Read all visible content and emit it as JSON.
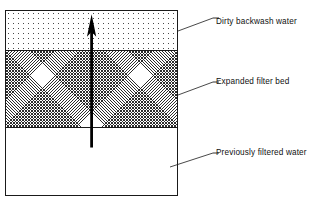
{
  "diagram": {
    "vessel": {
      "layers": [
        {
          "id": "dirty-backwash-water",
          "label": "Dirty backwash water",
          "fill": "stipple",
          "color": "#4a4a4a"
        },
        {
          "id": "expanded-filter-bed",
          "label": "Expanded filter bed",
          "fill": "crosshatch",
          "color": "#2d2d2d"
        },
        {
          "id": "previously-filtered-water",
          "label": "Previously filtered water",
          "fill": "none",
          "color": "#ffffff"
        }
      ],
      "border_color": "#1a1a1a"
    },
    "flow_arrow": {
      "name": "upflow-arrow",
      "direction": "up",
      "color": "#000000"
    }
  }
}
